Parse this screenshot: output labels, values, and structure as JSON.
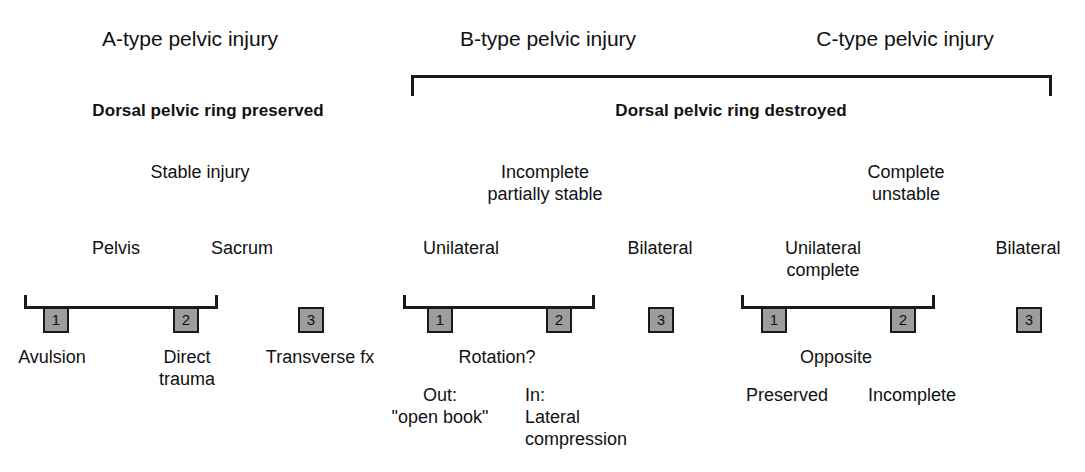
{
  "figure": {
    "kind": "classification-tree",
    "background_color": "#ffffff",
    "text_color": "#111111",
    "box_fill_color": "#9d9d9d",
    "box_border_color": "#1a1a1a",
    "line_color": "#1a1a1a"
  },
  "titles": {
    "a": "A-type pelvic injury",
    "b": "B-type pelvic injury",
    "c": "C-type pelvic injury"
  },
  "subtitles": {
    "a": "Dorsal pelvic ring preserved",
    "bc": "Dorsal pelvic ring destroyed"
  },
  "stability": {
    "a": "Stable injury",
    "b_line1": "Incomplete",
    "b_line2": "partially stable",
    "c_line1": "Complete",
    "c_line2": "unstable"
  },
  "sidedness": {
    "a_pelvis": "Pelvis",
    "a_sacrum": "Sacrum",
    "b_unilateral": "Unilateral",
    "b_bilateral": "Bilateral",
    "c_unilateral_line1": "Unilateral",
    "c_unilateral_line2": "complete",
    "c_bilateral": "Bilateral"
  },
  "boxes": {
    "a1": "1",
    "a2": "2",
    "a3": "3",
    "b1": "1",
    "b2": "2",
    "b3": "3",
    "c1": "1",
    "c2": "2",
    "c3": "3"
  },
  "details": {
    "a1": "Avulsion",
    "a2_line1": "Direct",
    "a2_line2": "trauma",
    "a3": "Transverse fx",
    "b_rotation": "Rotation?",
    "b1_line1": "Out:",
    "b1_line2": "\"open book\"",
    "b2_line1": "In:",
    "b2_line2": "Lateral",
    "b2_line3": "compression",
    "c_opposite": "Opposite",
    "c1": "Preserved",
    "c2": "Incomplete"
  }
}
